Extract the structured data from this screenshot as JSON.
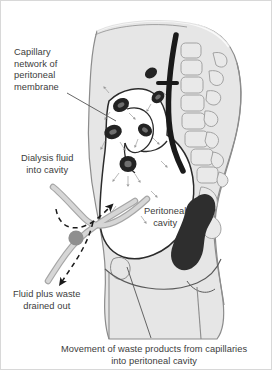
{
  "figure": {
    "background_color": "#ffffff",
    "border_color": "#d8d8d8",
    "text_color": "#3c3c3c"
  },
  "labels": {
    "capillary_network": "Capillary\nnetwork of\nperitoneal\nmembrane",
    "dialysis_fluid": "Dialysis fluid\ninto cavity",
    "peritoneal_cavity": "Peritoneal\ncavity",
    "fluid_drained": "Fluid plus waste\ndrained out",
    "movement_caption": "Movement of waste products from capillaries\ninto peritoneal cavity"
  },
  "anatomy": {
    "body_fill": "#e6e6e6",
    "body_outline": "#8c8c8c",
    "cavity_fill": "#ffffff",
    "cavity_outline": "#2b2b2b",
    "vertebra_fill": "#e9e9e9",
    "vertebra_outline": "#9a9a9a",
    "capillary_fill": "#232323",
    "rectum_fill": "#2e2e2e",
    "catheter_fill": "#1a1a1a",
    "tube_fill": "#d0d0d0",
    "tube_outline": "#a6a6a6",
    "connector_fill": "#8f8f8f",
    "leader_color": "#555555",
    "arrow_color": "#1a1a1a",
    "parts": [
      "torso",
      "spine-vertebrae",
      "peritoneal-cavity",
      "peritoneal-membrane",
      "capillaries",
      "rectum",
      "bladder",
      "catheter",
      "inflow-tube",
      "outflow-tube",
      "tube-connector"
    ],
    "capillary_count": 6,
    "vertebra_count": 8
  },
  "flow": {
    "inflow_arrow": "dashed-arrow-up-right",
    "outflow_arrow": "dashed-arrow-down-left",
    "diffusion_arrows": "small-arrows-from-capillaries"
  }
}
